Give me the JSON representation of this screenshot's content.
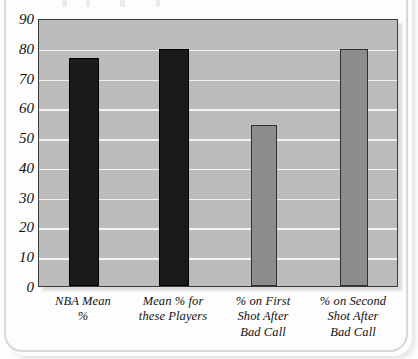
{
  "figure": {
    "name": "free-throw-percentage-bar-chart"
  },
  "chart_data": {
    "type": "bar",
    "title": "",
    "xlabel": "",
    "ylabel": "",
    "ylim": [
      0,
      90
    ],
    "yticks": [
      0,
      10,
      20,
      30,
      40,
      50,
      60,
      70,
      80,
      90
    ],
    "grid": true,
    "legend": "none",
    "categories": [
      "NBA Mean %",
      "Mean % for these Players",
      "% on First Shot After Bad Call",
      "% on Second Shot After Bad Call"
    ],
    "category_lines": [
      [
        "NBA Mean",
        "%"
      ],
      [
        "Mean % for",
        "these Players"
      ],
      [
        "% on First",
        "Shot After",
        "Bad Call"
      ],
      [
        "% on Second",
        "Shot After",
        "Bad Call"
      ]
    ],
    "values": [
      76.5,
      79.5,
      54,
      79.5
    ],
    "bar_colors": [
      "#1a1a1a",
      "#1a1a1a",
      "#8d8d8d",
      "#8d8d8d"
    ]
  },
  "colors": {
    "plot_background": "#bcbcbc",
    "gridline": "#f2f2f2",
    "axis_line": "#3b3b3b",
    "dark_bar": "#1a1a1a",
    "light_bar": "#8d8d8d",
    "page_background": "#fdfdfd"
  }
}
